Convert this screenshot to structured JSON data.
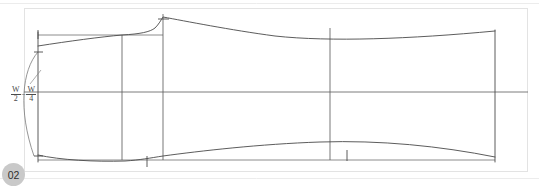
{
  "page": {
    "badge_label": "02",
    "background_color": "#ffffff",
    "line_color": "#4a4a4a",
    "frame_color": "#e3e3e3",
    "badge_color": "#c9c9c9"
  },
  "dimension": {
    "label_text": "W/2 - W/4",
    "numerator_left": "W",
    "denominator_left": "2",
    "operator": "−",
    "numerator_right": "W",
    "denominator_right": "4"
  },
  "drawing": {
    "kind": "plan-view-half-breadth-loft",
    "canvas": {
      "width": 539,
      "height": 187
    },
    "frame": {
      "x": 24,
      "y": 8,
      "width": 504,
      "height": 164
    },
    "frame_rules": [
      {
        "y": 4
      },
      {
        "y": 178
      }
    ],
    "baseline_top": {
      "x1": 38,
      "y1": 35,
      "x2": 163,
      "y2": 35
    },
    "baseline_bottom": {
      "x1": 38,
      "y1": 160,
      "x2": 495,
      "y2": 160
    },
    "centerline": {
      "x1": 24,
      "y1": 92,
      "x2": 528,
      "y2": 92
    },
    "left_edge": {
      "x": 38,
      "y1": 32,
      "y2": 162
    },
    "right_edge": {
      "x": 495,
      "y1": 30,
      "y2": 162
    },
    "stations": [
      {
        "name": "station-1",
        "x": 122,
        "y1": 35,
        "y2": 160
      },
      {
        "name": "station-2",
        "x": 163,
        "y1": 14,
        "y2": 160
      },
      {
        "name": "station-3",
        "x": 330,
        "y1": 28,
        "y2": 160
      }
    ],
    "apex": {
      "x": 163,
      "y": 17
    },
    "ticks": [
      {
        "name": "tick-left-upper",
        "x": 38,
        "y1": 30,
        "y2": 38
      },
      {
        "name": "tick-left-mid-upper",
        "x": 38,
        "y1": 48,
        "y2": 56
      },
      {
        "name": "tick-left-lower",
        "x": 38,
        "y1": 150,
        "y2": 158
      },
      {
        "name": "tick-apex",
        "x": 163,
        "y1": 13,
        "y2": 22
      },
      {
        "name": "tick-bottom-center",
        "x": 147,
        "y1": 156,
        "y2": 166
      },
      {
        "name": "tick-bottom-right",
        "x": 347,
        "y1": 150,
        "y2": 162
      }
    ],
    "upper_curve": "M 38,46 C 70,41 100,37 122,35 C 140,34 150,32 155,28 C 159,24 161,20 163,17 C 185,21 230,30 275,36 C 330,42 410,39 495,31",
    "lower_curve": "M 38,155 C 60,160 95,162 125,161 C 140,160 150,158 163,156 C 200,151 260,144 320,142 C 380,140 440,146 495,157",
    "dim_arc": "M 38,52 C 22,70 18,110 34,156",
    "leader": {
      "x1": 30,
      "y1": 84,
      "x2": 40,
      "y2": 72
    }
  }
}
